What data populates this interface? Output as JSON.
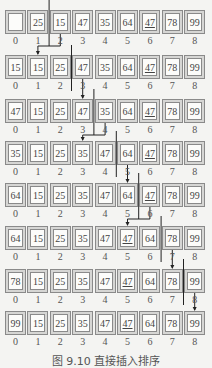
{
  "diagram": {
    "indices": [
      "0",
      "1",
      "2",
      "3",
      "4",
      "5",
      "6",
      "7",
      "8"
    ],
    "rows": [
      {
        "values": [
          "",
          "25",
          "15",
          "47",
          "35",
          "64",
          "47",
          "78",
          "99"
        ],
        "underlined": [
          6
        ],
        "divider_after": 1,
        "insert_from": 2,
        "insert_to": 1
      },
      {
        "values": [
          "15",
          "15",
          "25",
          "47",
          "35",
          "64",
          "47",
          "78",
          "99"
        ],
        "underlined": [
          6
        ],
        "divider_after": 2,
        "insert_from": 3,
        "insert_to": 3
      },
      {
        "values": [
          "47",
          "15",
          "25",
          "47",
          "35",
          "64",
          "47",
          "78",
          "99"
        ],
        "underlined": [
          6
        ],
        "divider_after": 3,
        "insert_from": 4,
        "insert_to": 3
      },
      {
        "values": [
          "35",
          "15",
          "25",
          "35",
          "47",
          "64",
          "47",
          "78",
          "99"
        ],
        "underlined": [
          6
        ],
        "divider_after": 4,
        "insert_from": 5,
        "insert_to": 5
      },
      {
        "values": [
          "64",
          "15",
          "25",
          "35",
          "47",
          "64",
          "47",
          "78",
          "99"
        ],
        "underlined": [
          6
        ],
        "divider_after": 5,
        "insert_from": 6,
        "insert_to": 5
      },
      {
        "values": [
          "64",
          "15",
          "25",
          "35",
          "47",
          "47",
          "64",
          "78",
          "99"
        ],
        "underlined": [
          5
        ],
        "divider_after": 6,
        "insert_from": 7,
        "insert_to": 7
      },
      {
        "values": [
          "78",
          "15",
          "25",
          "35",
          "47",
          "47",
          "64",
          "78",
          "99"
        ],
        "underlined": [
          5
        ],
        "divider_after": 7,
        "insert_from": 8,
        "insert_to": 8
      },
      {
        "values": [
          "99",
          "15",
          "25",
          "35",
          "47",
          "47",
          "64",
          "78",
          "99"
        ],
        "underlined": [
          5
        ],
        "divider_after": null,
        "insert_from": null,
        "insert_to": null
      }
    ]
  },
  "caption": "图 9.10  直接插入排序"
}
